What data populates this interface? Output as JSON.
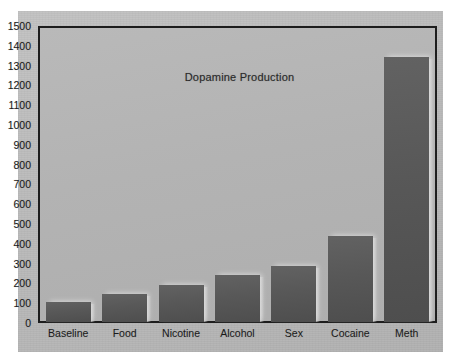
{
  "chart_data": {
    "type": "bar",
    "title": "Dopamine Production",
    "xlabel": "",
    "ylabel": "",
    "categories": [
      "Baseline",
      "Food",
      "Nicotine",
      "Alcohol",
      "Sex",
      "Cocaine",
      "Meth"
    ],
    "values": [
      100,
      145,
      190,
      240,
      285,
      440,
      1350
    ],
    "ylim": [
      0,
      1500
    ],
    "ytick_step": 100,
    "yticks": [
      0,
      100,
      200,
      300,
      400,
      500,
      600,
      700,
      800,
      900,
      1000,
      1100,
      1200,
      1300,
      1400,
      1500
    ],
    "ytick_labels": [
      "0",
      "100",
      "200",
      "300",
      "400",
      "500",
      "600",
      "700",
      "800",
      "900",
      "1000",
      "1100",
      "1200",
      "1300",
      "1400",
      "1500"
    ],
    "grid": false,
    "legend": null,
    "legend_position": "none",
    "annotations": [],
    "colors": {
      "bar": "#585858",
      "plot_background": "#b4b4b4",
      "page_background": "#bbbbbb",
      "axis": "#1d1d1d",
      "text": "#1a1a1a"
    }
  }
}
